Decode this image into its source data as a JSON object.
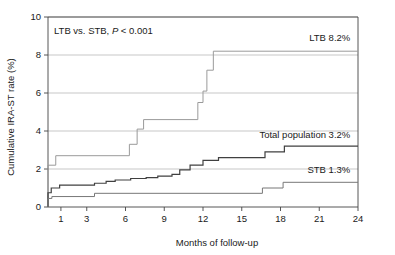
{
  "chart_data": {
    "type": "line",
    "title": "",
    "xlabel": "Months of follow-up",
    "ylabel": "Cumulative IRA-ST rate (%)",
    "xlim": [
      0,
      24
    ],
    "ylim": [
      0,
      10
    ],
    "xticks": [
      1,
      3,
      6,
      9,
      12,
      15,
      18,
      21,
      24
    ],
    "xtick_labels": [
      "1",
      "3",
      "6",
      "9",
      "12",
      "15",
      "18",
      "21",
      "24"
    ],
    "yticks": [
      0,
      2,
      4,
      6,
      8,
      10
    ],
    "ytick_labels": [
      "0",
      "2",
      "4",
      "6",
      "8",
      "10"
    ],
    "grid": "horizontal",
    "legend_position": "inline-right",
    "annotation": "LTB vs. STB, P < 0.001",
    "annotation_parts": {
      "prefix": "LTB vs. STB, ",
      "italic": "P",
      "suffix": " < 0.001"
    },
    "series": [
      {
        "name": "LTB",
        "label": "LTB 8.2%",
        "final_value": 8.2,
        "color": "#9a9a9a",
        "stroke_width": 1.0,
        "steps": [
          [
            0,
            0
          ],
          [
            0,
            2.2
          ],
          [
            0.6,
            2.2
          ],
          [
            0.6,
            2.7
          ],
          [
            6.3,
            2.7
          ],
          [
            6.3,
            3.3
          ],
          [
            6.9,
            3.3
          ],
          [
            6.9,
            4.1
          ],
          [
            7.4,
            4.1
          ],
          [
            7.4,
            4.6
          ],
          [
            11.6,
            4.6
          ],
          [
            11.6,
            5.5
          ],
          [
            12.0,
            5.5
          ],
          [
            12.0,
            6.1
          ],
          [
            12.3,
            6.1
          ],
          [
            12.3,
            7.2
          ],
          [
            12.8,
            7.2
          ],
          [
            12.8,
            8.2
          ],
          [
            24,
            8.2
          ]
        ]
      },
      {
        "name": "Total population",
        "label": "Total population 3.2%",
        "final_value": 3.2,
        "color": "#404040",
        "stroke_width": 1.2,
        "steps": [
          [
            0,
            0
          ],
          [
            0,
            0.75
          ],
          [
            0.25,
            0.75
          ],
          [
            0.25,
            1.0
          ],
          [
            0.9,
            1.0
          ],
          [
            0.9,
            1.15
          ],
          [
            3.6,
            1.15
          ],
          [
            3.6,
            1.25
          ],
          [
            4.5,
            1.25
          ],
          [
            4.5,
            1.35
          ],
          [
            5.2,
            1.35
          ],
          [
            5.2,
            1.42
          ],
          [
            6.4,
            1.42
          ],
          [
            6.4,
            1.5
          ],
          [
            7.6,
            1.5
          ],
          [
            7.6,
            1.55
          ],
          [
            8.5,
            1.55
          ],
          [
            8.5,
            1.62
          ],
          [
            9.6,
            1.62
          ],
          [
            9.6,
            1.72
          ],
          [
            10.2,
            1.72
          ],
          [
            10.2,
            1.95
          ],
          [
            11.0,
            1.95
          ],
          [
            11.0,
            2.2
          ],
          [
            12.0,
            2.2
          ],
          [
            12.0,
            2.45
          ],
          [
            13.2,
            2.45
          ],
          [
            13.2,
            2.6
          ],
          [
            16.8,
            2.6
          ],
          [
            16.8,
            2.9
          ],
          [
            18.3,
            2.9
          ],
          [
            18.3,
            3.2
          ],
          [
            24,
            3.2
          ]
        ]
      },
      {
        "name": "STB",
        "label": "STB 1.3%",
        "final_value": 1.3,
        "color": "#777777",
        "stroke_width": 1.0,
        "steps": [
          [
            0,
            0
          ],
          [
            0,
            0.45
          ],
          [
            0.3,
            0.45
          ],
          [
            0.3,
            0.55
          ],
          [
            3.6,
            0.55
          ],
          [
            3.6,
            0.72
          ],
          [
            16.6,
            0.72
          ],
          [
            16.6,
            1.0
          ],
          [
            18.2,
            1.0
          ],
          [
            18.2,
            1.3
          ],
          [
            24,
            1.3
          ]
        ]
      }
    ],
    "series_label_positions": [
      {
        "name": "LTB",
        "x": 23.4,
        "y": 8.75,
        "anchor": "end"
      },
      {
        "name": "Total population",
        "x": 23.4,
        "y": 3.65,
        "anchor": "end"
      },
      {
        "name": "STB",
        "x": 23.4,
        "y": 1.78,
        "anchor": "end"
      }
    ],
    "colors": {
      "axis": "#444444",
      "grid": "#b0b0b0",
      "background": "#ffffff",
      "text": "#1a1a1a"
    }
  }
}
